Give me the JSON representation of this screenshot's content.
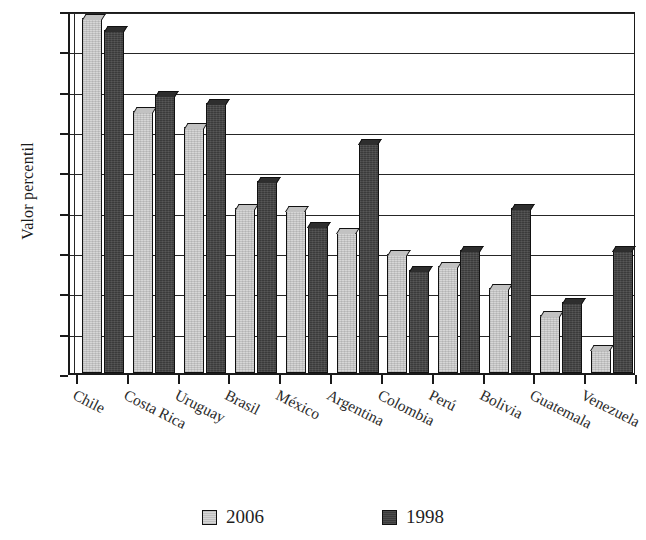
{
  "chart_data": {
    "type": "bar",
    "title": "",
    "subtitle": "",
    "xlabel": "",
    "ylabel": "Valor percentil",
    "ylim": [
      0,
      90
    ],
    "ytick_step": 10,
    "yticks": [
      0,
      10,
      20,
      30,
      40,
      50,
      60,
      70,
      80,
      90
    ],
    "grid": "horizontal",
    "legend_position": "bottom",
    "categories": [
      "Chile",
      "Costa Rica",
      "Uruguay",
      "Brasil",
      "México",
      "Argentina",
      "Colombia",
      "Perú",
      "Bolivia",
      "Guatemala",
      "Venezuela"
    ],
    "series": [
      {
        "name": "2006",
        "color": "#d6d6d6",
        "values": [
          88,
          65,
          61,
          41,
          40.5,
          35,
          29.5,
          26.5,
          21,
          14.5,
          6
        ]
      },
      {
        "name": "1998",
        "color": "#3b3b3b",
        "values": [
          85,
          69,
          67,
          47.5,
          36.5,
          57,
          25.5,
          30.5,
          41,
          17.5,
          30.5
        ]
      }
    ]
  },
  "axis": {
    "y_title": "Valor percentil"
  },
  "legend": {
    "items": [
      {
        "label": "2006",
        "swatch": "light-gray-swatch"
      },
      {
        "label": "1998",
        "swatch": "dark-gray-swatch"
      }
    ]
  }
}
